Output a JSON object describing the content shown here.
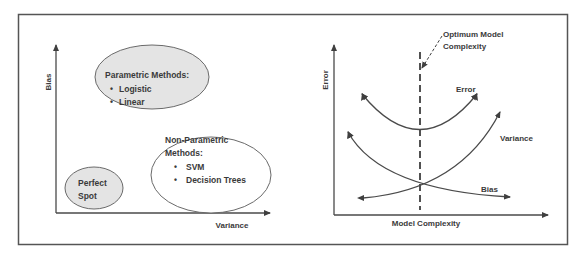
{
  "colors": {
    "stroke": "#4a4a4a",
    "frame": "#555555",
    "ellipse_fill_gray": "#e4e4e4",
    "ellipse_fill_white": "#ffffff",
    "text": "#3a3a3a"
  },
  "left_panel": {
    "y_axis_label": "Bias",
    "x_axis_label": "Variance",
    "parametric": {
      "title": "Parametric Methods:",
      "items": [
        "Logistic",
        "Linear"
      ]
    },
    "non_parametric": {
      "title_line1": "Non-Parametric",
      "title_line2": "Methods:",
      "items": [
        "SVM",
        "Decision Trees"
      ]
    },
    "perfect_spot": {
      "line1": "Perfect",
      "line2": "Spot"
    }
  },
  "right_panel": {
    "y_axis_label": "Error",
    "x_axis_label": "Model Complexity",
    "annotation_line1": "Optimum Model",
    "annotation_line2": "Complexity",
    "curves": {
      "error": "Error",
      "variance": "Variance",
      "bias": "Bias"
    }
  },
  "bullet": "•"
}
